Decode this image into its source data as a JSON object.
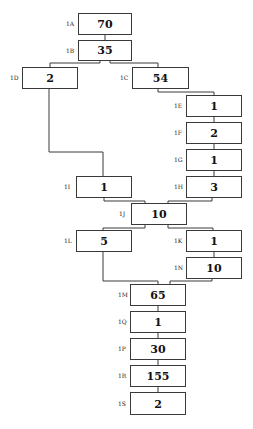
{
  "diagram": {
    "type": "flow-tree",
    "nodes": [
      {
        "id": "1A",
        "label": "1A",
        "value": "70",
        "x": 78,
        "y": 13,
        "w": 54,
        "h": 22
      },
      {
        "id": "1B",
        "label": "1B",
        "value": "35",
        "x": 78,
        "y": 40,
        "w": 54,
        "h": 21
      },
      {
        "id": "1D",
        "label": "1D",
        "value": "2",
        "x": 22,
        "y": 67,
        "w": 56,
        "h": 22
      },
      {
        "id": "1C",
        "label": "1C",
        "value": "54",
        "x": 132,
        "y": 67,
        "w": 57,
        "h": 22
      },
      {
        "id": "1E",
        "label": "1E",
        "value": "1",
        "x": 186,
        "y": 95,
        "w": 56,
        "h": 22
      },
      {
        "id": "1F",
        "label": "1F",
        "value": "2",
        "x": 186,
        "y": 122,
        "w": 56,
        "h": 22
      },
      {
        "id": "1G",
        "label": "1G",
        "value": "1",
        "x": 186,
        "y": 149,
        "w": 56,
        "h": 22
      },
      {
        "id": "1H",
        "label": "1H",
        "value": "3",
        "x": 186,
        "y": 176,
        "w": 56,
        "h": 22
      },
      {
        "id": "1I",
        "label": "1I",
        "value": "1",
        "x": 76,
        "y": 176,
        "w": 56,
        "h": 22
      },
      {
        "id": "1J",
        "label": "1J",
        "value": "10",
        "x": 131,
        "y": 203,
        "w": 56,
        "h": 22
      },
      {
        "id": "1L",
        "label": "1L",
        "value": "5",
        "x": 76,
        "y": 230,
        "w": 56,
        "h": 22
      },
      {
        "id": "1K",
        "label": "1K",
        "value": "1",
        "x": 186,
        "y": 230,
        "w": 56,
        "h": 22
      },
      {
        "id": "1N",
        "label": "1N",
        "value": "10",
        "x": 186,
        "y": 257,
        "w": 56,
        "h": 22
      },
      {
        "id": "1M",
        "label": "1M",
        "value": "65",
        "x": 130,
        "y": 284,
        "w": 56,
        "h": 22
      },
      {
        "id": "1Q",
        "label": "1Q",
        "value": "1",
        "x": 130,
        "y": 311,
        "w": 56,
        "h": 22
      },
      {
        "id": "1P",
        "label": "1P",
        "value": "30",
        "x": 130,
        "y": 338,
        "w": 56,
        "h": 22
      },
      {
        "id": "1R",
        "label": "1R",
        "value": "155",
        "x": 130,
        "y": 365,
        "w": 56,
        "h": 22
      },
      {
        "id": "1S",
        "label": "1S",
        "value": "2",
        "x": 130,
        "y": 392,
        "w": 56,
        "h": 23
      }
    ],
    "edges": [
      [
        "1A",
        "1B"
      ],
      [
        "1B",
        "1D"
      ],
      [
        "1B",
        "1C"
      ],
      [
        "1C",
        "1E"
      ],
      [
        "1E",
        "1F"
      ],
      [
        "1F",
        "1G"
      ],
      [
        "1G",
        "1H"
      ],
      [
        "1D",
        "1I"
      ],
      [
        "1I",
        "1J"
      ],
      [
        "1H",
        "1J"
      ],
      [
        "1J",
        "1L"
      ],
      [
        "1J",
        "1K"
      ],
      [
        "1K",
        "1N"
      ],
      [
        "1L",
        "1M"
      ],
      [
        "1N",
        "1M"
      ],
      [
        "1M",
        "1Q"
      ],
      [
        "1Q",
        "1P"
      ],
      [
        "1P",
        "1R"
      ],
      [
        "1R",
        "1S"
      ]
    ]
  }
}
